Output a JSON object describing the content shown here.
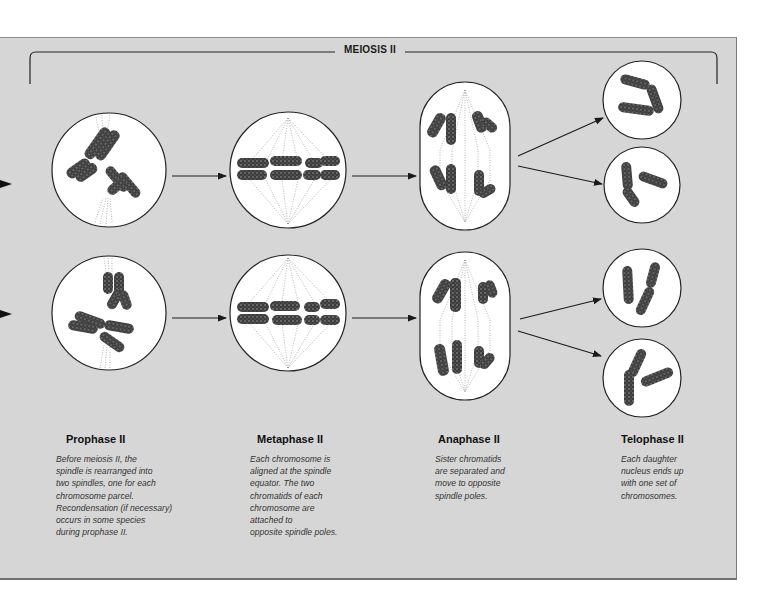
{
  "diagram": {
    "title": "MEIOSIS II",
    "colors": {
      "panel_background": "#d6d6d6",
      "cell_fill": "#ffffff",
      "chromosome": "#3a3a3a",
      "outline": "#222222"
    },
    "stages": [
      {
        "name": "Prophase II",
        "description_lines": [
          "Before meiosis II, the",
          "spindle is rearranged into",
          "two spindles, one for each",
          "chromosome parcel.",
          "Recondensation (if necessary)",
          "occurs in some species",
          "during prophase II."
        ]
      },
      {
        "name": "Metaphase II",
        "description_lines": [
          "Each chromosome is",
          "aligned at the spindle",
          "equator. The two",
          "chromatids of each",
          "chromosome are",
          "attached to",
          "opposite spindle poles."
        ]
      },
      {
        "name": "Anaphase II",
        "description_lines": [
          "Sister chromatids",
          "are separated and",
          "move to opposite",
          "spindle poles."
        ]
      },
      {
        "name": "Telophase II",
        "description_lines": [
          "Each daughter",
          "nucleus ends up",
          "with one set of",
          "chromosomes."
        ]
      }
    ],
    "rows": [
      {
        "name": "upper-lineage",
        "cells": [
          "prophase-ii",
          "metaphase-ii",
          "anaphase-ii",
          "telophase-ii-daughter-a",
          "telophase-ii-daughter-b"
        ]
      },
      {
        "name": "lower-lineage",
        "cells": [
          "prophase-ii",
          "metaphase-ii",
          "anaphase-ii",
          "telophase-ii-daughter-a",
          "telophase-ii-daughter-b"
        ]
      }
    ]
  }
}
